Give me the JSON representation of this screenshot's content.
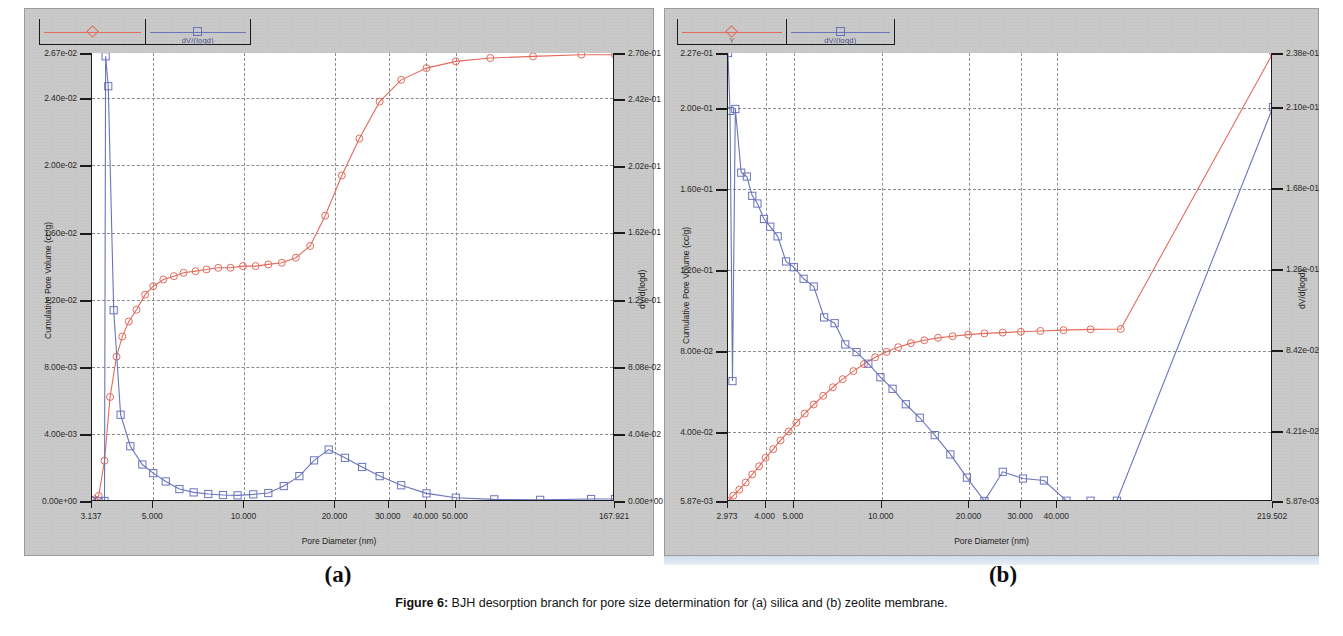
{
  "caption": {
    "prefix": "Figure 6:",
    "text": " BJH desorption branch for pore size determination for (a) silica and (b) zeolite membrane."
  },
  "colors": {
    "cumulative": "#e36b5c",
    "dv": "#6a74bd",
    "axis": "#1b1b1b",
    "grid": "#8d8d8d",
    "matte": "#c9c9c9"
  },
  "panels": [
    {
      "sublabel": "(a)",
      "legend": [
        {
          "name": "cumulative-pore-volume",
          "label": "",
          "marker": "diamond",
          "color": "#e36b5c"
        },
        {
          "name": "dv-dlogd",
          "label": "dV/(logd)",
          "marker": "square",
          "color": "#6a74bd"
        }
      ],
      "chart_data": {
        "type": "line",
        "title": "",
        "xlabel": "Pore Diameter (nm)",
        "ylabel": "Cumulative Pore Volume (cc/g)",
        "y2label": "dV/d(logd)",
        "xscale": "log",
        "xlim": [
          3.137,
          167.921
        ],
        "xticks": [
          "3.137",
          "5.000",
          "10.000",
          "20.000",
          "30.000",
          "40.000",
          "50.000",
          "167.921"
        ],
        "xtickvals": [
          3.137,
          5.0,
          10.0,
          20.0,
          30.0,
          40.0,
          50.0,
          167.921
        ],
        "ylim": [
          0.0,
          0.0267
        ],
        "yticks": [
          "0.00e+00",
          "4.00e-03",
          "8.00e-03",
          "1.20e-02",
          "1.60e-02",
          "2.00e-02",
          "2.40e-02",
          "2.67e-02"
        ],
        "ytickvals": [
          0.0,
          0.004,
          0.008,
          0.012,
          0.016,
          0.02,
          0.024,
          0.0267
        ],
        "y2lim": [
          0.0,
          0.27
        ],
        "y2ticks": [
          "0.00e+00",
          "4.04e-02",
          "8.08e-02",
          "1.21e-01",
          "1.62e-01",
          "2.02e-01",
          "2.42e-01",
          "2.70e-01"
        ],
        "y2tickvals": [
          0.0,
          0.0404,
          0.0808,
          0.121,
          0.162,
          0.202,
          0.242,
          0.27
        ],
        "grid": true,
        "legend_position": "top",
        "series": [
          {
            "name": "Cumulative Pore Volume (cc/g)",
            "axis": "left",
            "color": "#e36b5c",
            "marker": "circle",
            "x": [
              3.137,
              3.2,
              3.3,
              3.45,
              3.6,
              3.78,
              3.95,
              4.15,
              4.4,
              4.7,
              5.0,
              5.4,
              5.85,
              6.3,
              6.9,
              7.5,
              8.2,
              9.0,
              9.9,
              10.9,
              12.0,
              13.3,
              14.8,
              16.5,
              18.5,
              21.0,
              24.0,
              28.0,
              33.0,
              40.0,
              50.0,
              65.0,
              90.0,
              130.0,
              167.921
            ],
            "y": [
              0.0,
              0.0001,
              0.0003,
              0.0024,
              0.0062,
              0.0086,
              0.0098,
              0.0107,
              0.0114,
              0.0123,
              0.0128,
              0.0132,
              0.0134,
              0.0136,
              0.0137,
              0.0138,
              0.0139,
              0.0139,
              0.014,
              0.014,
              0.0141,
              0.0142,
              0.0145,
              0.0152,
              0.017,
              0.0194,
              0.0216,
              0.0238,
              0.0251,
              0.0258,
              0.0262,
              0.0264,
              0.0265,
              0.0266,
              0.0266
            ]
          },
          {
            "name": "dV/d(logd)",
            "axis": "right",
            "color": "#6a74bd",
            "marker": "square",
            "x": [
              3.137,
              3.3,
              3.45,
              3.48,
              3.55,
              3.7,
              3.9,
              4.2,
              4.6,
              5.0,
              5.5,
              6.1,
              6.8,
              7.6,
              8.5,
              9.5,
              10.7,
              12.0,
              13.5,
              15.2,
              17.0,
              19.0,
              21.5,
              24.5,
              28.0,
              33.0,
              40.0,
              50.0,
              67.0,
              95.0,
              140.0,
              167.921
            ],
            "y": [
              0.0,
              0.0,
              0.0,
              0.268,
              0.25,
              0.115,
              0.052,
              0.033,
              0.022,
              0.0168,
              0.0118,
              0.0072,
              0.0052,
              0.0042,
              0.0036,
              0.0034,
              0.004,
              0.0048,
              0.009,
              0.015,
              0.0245,
              0.031,
              0.026,
              0.0205,
              0.015,
              0.0095,
              0.0046,
              0.002,
              0.001,
              0.0007,
              0.0012,
              0.0012
            ]
          }
        ]
      }
    },
    {
      "sublabel": "(b)",
      "legend": [
        {
          "name": "cumulative-pore-volume",
          "label": "Y",
          "marker": "diamond",
          "color": "#e36b5c"
        },
        {
          "name": "dv-dlogd",
          "label": "dV/(logd)",
          "marker": "square",
          "color": "#6a74bd"
        }
      ],
      "chart_data": {
        "type": "line",
        "title": "",
        "xlabel": "Pore Diameter (nm)",
        "ylabel": "Cumulative Pore Volume (cc/g)",
        "y2label": "dV/d(logd)",
        "xscale": "log",
        "xlim": [
          2.973,
          219.502
        ],
        "xticks": [
          "2.973",
          "4.000",
          "5.000",
          "10.000",
          "20.000",
          "30.000",
          "40.000",
          "219.502"
        ],
        "xtickvals": [
          2.973,
          4.0,
          5.0,
          10.0,
          20.0,
          30.0,
          40.0,
          219.502
        ],
        "ylim": [
          0.00587,
          0.227
        ],
        "yticks": [
          "5.87e-03",
          "4.00e-02",
          "8.00e-02",
          "1.20e-01",
          "1.60e-01",
          "2.00e-01",
          "2.27e-01"
        ],
        "ytickvals": [
          0.00587,
          0.04,
          0.08,
          0.12,
          0.16,
          0.2,
          0.227
        ],
        "y2lim": [
          0.00587,
          0.238
        ],
        "y2ticks": [
          "5.87e-03",
          "4.21e-02",
          "8.42e-02",
          "1.26e-01",
          "1.68e-01",
          "2.10e-01",
          "2.38e-01"
        ],
        "y2tickvals": [
          0.00587,
          0.0421,
          0.0842,
          0.126,
          0.168,
          0.21,
          0.238
        ],
        "grid": true,
        "legend_position": "top",
        "series": [
          {
            "name": "Cumulative Pore Volume (cc/g)",
            "axis": "left",
            "color": "#e36b5c",
            "marker": "circle",
            "x": [
              2.973,
              3.1,
              3.25,
              3.42,
              3.6,
              3.8,
              4.0,
              4.25,
              4.5,
              4.8,
              5.1,
              5.45,
              5.85,
              6.3,
              6.8,
              7.35,
              8.0,
              8.7,
              9.5,
              10.4,
              11.4,
              12.6,
              14.0,
              15.6,
              17.5,
              19.8,
              22.5,
              26.0,
              30.0,
              35.0,
              42.0,
              52.0,
              66.0,
              219.502
            ],
            "y": [
              0.00587,
              0.0085,
              0.0115,
              0.015,
              0.019,
              0.023,
              0.0272,
              0.0315,
              0.0358,
              0.0402,
              0.0445,
              0.049,
              0.0535,
              0.0578,
              0.062,
              0.066,
              0.07,
              0.0735,
              0.0768,
              0.0795,
              0.0818,
              0.0838,
              0.0852,
              0.0864,
              0.0872,
              0.088,
              0.0886,
              0.089,
              0.0894,
              0.0898,
              0.0902,
              0.0906,
              0.0908,
              0.227
            ]
          },
          {
            "name": "dV/d(logd)",
            "axis": "right",
            "color": "#6a74bd",
            "marker": "square",
            "x": [
              2.973,
              3.02,
              3.08,
              3.15,
              3.3,
              3.45,
              3.6,
              3.75,
              3.95,
              4.15,
              4.4,
              4.7,
              5.0,
              5.4,
              5.85,
              6.35,
              6.9,
              7.5,
              8.2,
              9.0,
              9.9,
              10.9,
              12.1,
              13.5,
              15.2,
              17.2,
              19.6,
              22.5,
              26.0,
              30.5,
              36.0,
              43.0,
              52.0,
              64.0,
              219.502
            ],
            "y": [
              0.238,
              0.208,
              0.068,
              0.209,
              0.176,
              0.174,
              0.164,
              0.16,
              0.152,
              0.148,
              0.143,
              0.13,
              0.127,
              0.121,
              0.117,
              0.101,
              0.098,
              0.087,
              0.083,
              0.077,
              0.07,
              0.064,
              0.056,
              0.049,
              0.04,
              0.03,
              0.018,
              0.0059,
              0.021,
              0.0175,
              0.0165,
              0.006,
              0.006,
              0.006,
              0.21
            ]
          }
        ]
      }
    }
  ]
}
